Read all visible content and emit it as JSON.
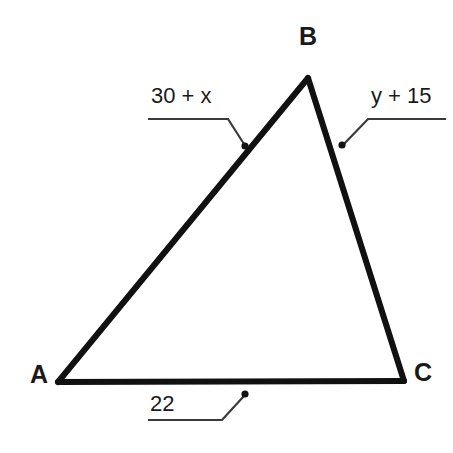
{
  "figure": {
    "type": "triangle-with-labeled-sides",
    "background_color": "#ffffff",
    "stroke_color": "#111111",
    "leader_color": "#3a3a3a",
    "text_color": "#1a1a1a"
  },
  "vertices": [
    {
      "name": "A",
      "label": "A",
      "x": 58,
      "y": 382
    },
    {
      "name": "B",
      "label": "B",
      "x": 308,
      "y": 78
    },
    {
      "name": "C",
      "label": "C",
      "x": 404,
      "y": 381
    }
  ],
  "sides": [
    {
      "name": "AB",
      "from": "A",
      "to": "B",
      "measure": "30 + x",
      "marker": {
        "x": 245,
        "y": 146
      }
    },
    {
      "name": "BC",
      "from": "B",
      "to": "C",
      "measure": "y + 15",
      "marker": {
        "x": 342,
        "y": 145
      }
    },
    {
      "name": "AC",
      "from": "A",
      "to": "C",
      "measure": "22",
      "marker": {
        "x": 245,
        "y": 394
      }
    }
  ],
  "labels": {
    "vertex_a": "A",
    "vertex_b": "B",
    "vertex_c": "C",
    "side_ab": "30 + x",
    "side_bc": "y + 15",
    "side_ac": "22"
  },
  "leaders": {
    "side_ab": {
      "underline": {
        "x1": 148,
        "y1": 119,
        "x2": 228,
        "y2": 119
      },
      "diagonal": {
        "x1": 228,
        "y1": 119,
        "x2": 244,
        "y2": 144
      }
    },
    "side_bc": {
      "underline": {
        "x1": 368,
        "y1": 119,
        "x2": 446,
        "y2": 119
      },
      "diagonal": {
        "x1": 368,
        "y1": 119,
        "x2": 344,
        "y2": 144
      }
    },
    "side_ac": {
      "underline": {
        "x1": 148,
        "y1": 420,
        "x2": 222,
        "y2": 420
      },
      "diagonal": {
        "x1": 222,
        "y1": 420,
        "x2": 244,
        "y2": 396
      }
    }
  }
}
